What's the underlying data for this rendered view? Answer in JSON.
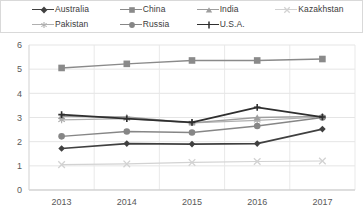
{
  "legend": {
    "items": [
      {
        "label": "Australia",
        "marker": "diamond",
        "color": "#404040",
        "width": 1.6
      },
      {
        "label": "China",
        "marker": "square",
        "color": "#8a8a8a",
        "width": 1.4
      },
      {
        "label": "India",
        "marker": "triangle",
        "color": "#9e9e9e",
        "width": 1.3
      },
      {
        "label": "Kazakhstan",
        "marker": "x",
        "color": "#d2d2d2",
        "width": 1.2
      },
      {
        "label": "Pakistan",
        "marker": "asterisk",
        "color": "#b0b0b0",
        "width": 1.2
      },
      {
        "label": "Russia",
        "marker": "circle",
        "color": "#868686",
        "width": 1.4
      },
      {
        "label": "U.S.A.",
        "marker": "plus",
        "color": "#2f2f2f",
        "width": 1.8
      }
    ]
  },
  "chart_data": {
    "type": "line",
    "title": "",
    "xlabel": "",
    "ylabel": "",
    "categories": [
      "2013",
      "2014",
      "2015",
      "2016",
      "2017"
    ],
    "yticks": [
      0,
      1,
      2,
      3,
      4,
      5,
      6
    ],
    "ylim": [
      0,
      6
    ],
    "grid": true,
    "legend_position": "top",
    "series": [
      {
        "name": "Australia",
        "marker": "diamond",
        "color": "#404040",
        "width": 1.6,
        "values": [
          1.72,
          1.92,
          1.9,
          1.92,
          2.52
        ]
      },
      {
        "name": "China",
        "marker": "square",
        "color": "#8a8a8a",
        "width": 1.4,
        "values": [
          5.05,
          5.22,
          5.36,
          5.36,
          5.42
        ]
      },
      {
        "name": "India",
        "marker": "triangle",
        "color": "#9e9e9e",
        "width": 1.3,
        "values": [
          3.05,
          3.02,
          2.78,
          3.0,
          3.05
        ]
      },
      {
        "name": "Kazakhstan",
        "marker": "x",
        "color": "#d2d2d2",
        "width": 1.2,
        "values": [
          1.05,
          1.08,
          1.14,
          1.18,
          1.2
        ]
      },
      {
        "name": "Pakistan",
        "marker": "asterisk",
        "color": "#b0b0b0",
        "width": 1.2,
        "values": [
          2.9,
          2.95,
          2.78,
          2.88,
          3.02
        ]
      },
      {
        "name": "Russia",
        "marker": "circle",
        "color": "#868686",
        "width": 1.4,
        "values": [
          2.22,
          2.42,
          2.38,
          2.65,
          3.0
        ]
      },
      {
        "name": "U.S.A.",
        "marker": "plus",
        "color": "#2f2f2f",
        "width": 1.8,
        "values": [
          3.12,
          2.95,
          2.8,
          3.42,
          3.02
        ]
      }
    ]
  },
  "axes": {
    "y_tick_labels": [
      "6",
      "5",
      "4",
      "3",
      "2",
      "1",
      "0"
    ],
    "x_tick_labels": [
      "2013",
      "2014",
      "2015",
      "2016",
      "2017"
    ]
  }
}
